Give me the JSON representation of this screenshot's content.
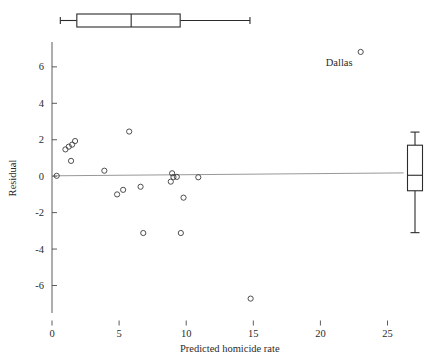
{
  "chart_data": {
    "type": "scatter",
    "title": "",
    "xlabel": "Predicted homicide rate",
    "ylabel": "Residual",
    "xlim": [
      0,
      26.6
    ],
    "ylim": [
      -7.4,
      7.2
    ],
    "xticks": [
      0,
      5,
      10,
      15,
      20,
      25
    ],
    "xticklabels": [
      "0",
      "5",
      "10",
      "15",
      "20",
      "25"
    ],
    "yticks": [
      -6,
      -4,
      -2,
      0,
      2,
      4,
      6
    ],
    "yticklabels": [
      "-6",
      "-4",
      "-2",
      "0",
      "2",
      "4",
      "6"
    ],
    "grid": false,
    "legend": false,
    "reference_line": {
      "y_left": 0.02,
      "y_right": 0.18,
      "x_left": 0.0,
      "x_right": 26.2
    },
    "points": [
      {
        "x": 0.35,
        "y": 0.02
      },
      {
        "x": 1.0,
        "y": 1.47
      },
      {
        "x": 1.25,
        "y": 1.62
      },
      {
        "x": 1.5,
        "y": 1.73
      },
      {
        "x": 1.72,
        "y": 1.93
      },
      {
        "x": 1.42,
        "y": 0.84
      },
      {
        "x": 3.9,
        "y": 0.3
      },
      {
        "x": 4.85,
        "y": -1.0
      },
      {
        "x": 5.3,
        "y": -0.75
      },
      {
        "x": 5.75,
        "y": 2.45
      },
      {
        "x": 6.6,
        "y": -0.58
      },
      {
        "x": 6.8,
        "y": -3.12
      },
      {
        "x": 8.85,
        "y": -0.3
      },
      {
        "x": 8.95,
        "y": 0.16
      },
      {
        "x": 9.05,
        "y": -0.05
      },
      {
        "x": 9.3,
        "y": -0.04
      },
      {
        "x": 9.6,
        "y": -3.12
      },
      {
        "x": 9.8,
        "y": -1.18
      },
      {
        "x": 10.9,
        "y": -0.06
      },
      {
        "x": 14.8,
        "y": -6.72
      },
      {
        "x": 23.0,
        "y": 6.82
      }
    ],
    "annotations": [
      {
        "text": "Dallas",
        "x": 21.4,
        "y": 6.05
      }
    ],
    "top_boxplot": {
      "orientation": "horizontal",
      "variable": "Predicted homicide rate",
      "whisker_low": 0.62,
      "q1": 1.85,
      "median": 5.9,
      "q3": 9.55,
      "whisker_high": 14.75
    },
    "right_boxplot": {
      "orientation": "vertical",
      "variable": "Residual",
      "whisker_low": -3.1,
      "q1": -0.8,
      "median": 0.05,
      "q3": 1.7,
      "whisker_high": 2.42
    }
  }
}
